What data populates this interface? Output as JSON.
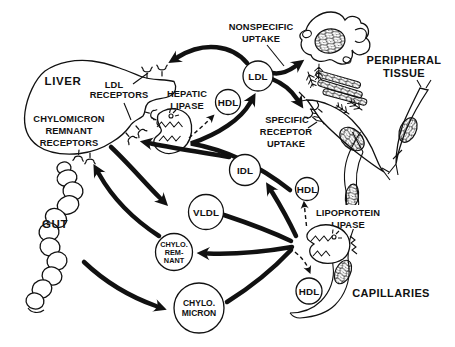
{
  "diagram": {
    "colors": {
      "ink": "#111111",
      "background": "#ffffff"
    },
    "organs": {
      "liver": {
        "label": "LIVER"
      },
      "gut": {
        "label": "GUT"
      },
      "peripheral_tissue": {
        "label_line1": "PERIPHERAL",
        "label_line2": "TISSUE"
      },
      "capillaries": {
        "label": "CAPILLARIES"
      }
    },
    "receptors": {
      "ldl_line1": "LDL",
      "ldl_line2": "RECEPTORS",
      "chylo_line1": "CHYLOMICRON",
      "chylo_line2": "REMNANT",
      "chylo_line3": "RECEPTORS"
    },
    "enzymes": {
      "hepatic_line1": "HEPATIC",
      "hepatic_line2": "LIPASE",
      "lpl_line1": "LIPOPROTEIN",
      "lpl_line2": "LIPASE"
    },
    "uptake": {
      "nonspecific_line1": "NONSPECIFIC",
      "nonspecific_line2": "UPTAKE",
      "specific_line1": "SPECIFIC",
      "specific_line2": "RECEPTOR",
      "specific_line3": "UPTAKE"
    },
    "particles": {
      "ldl": "LDL",
      "hdl_top": "HDL",
      "idl": "IDL",
      "hdl_mid": "HDL",
      "vldl": "VLDL",
      "chylo_remnant_line1": "CHYLO.",
      "chylo_remnant_line2": "REM-",
      "chylo_remnant_line3": "NANT",
      "hdl_bottom": "HDL",
      "chylomicron_line1": "CHYLO.",
      "chylomicron_line2": "MICRON"
    }
  }
}
